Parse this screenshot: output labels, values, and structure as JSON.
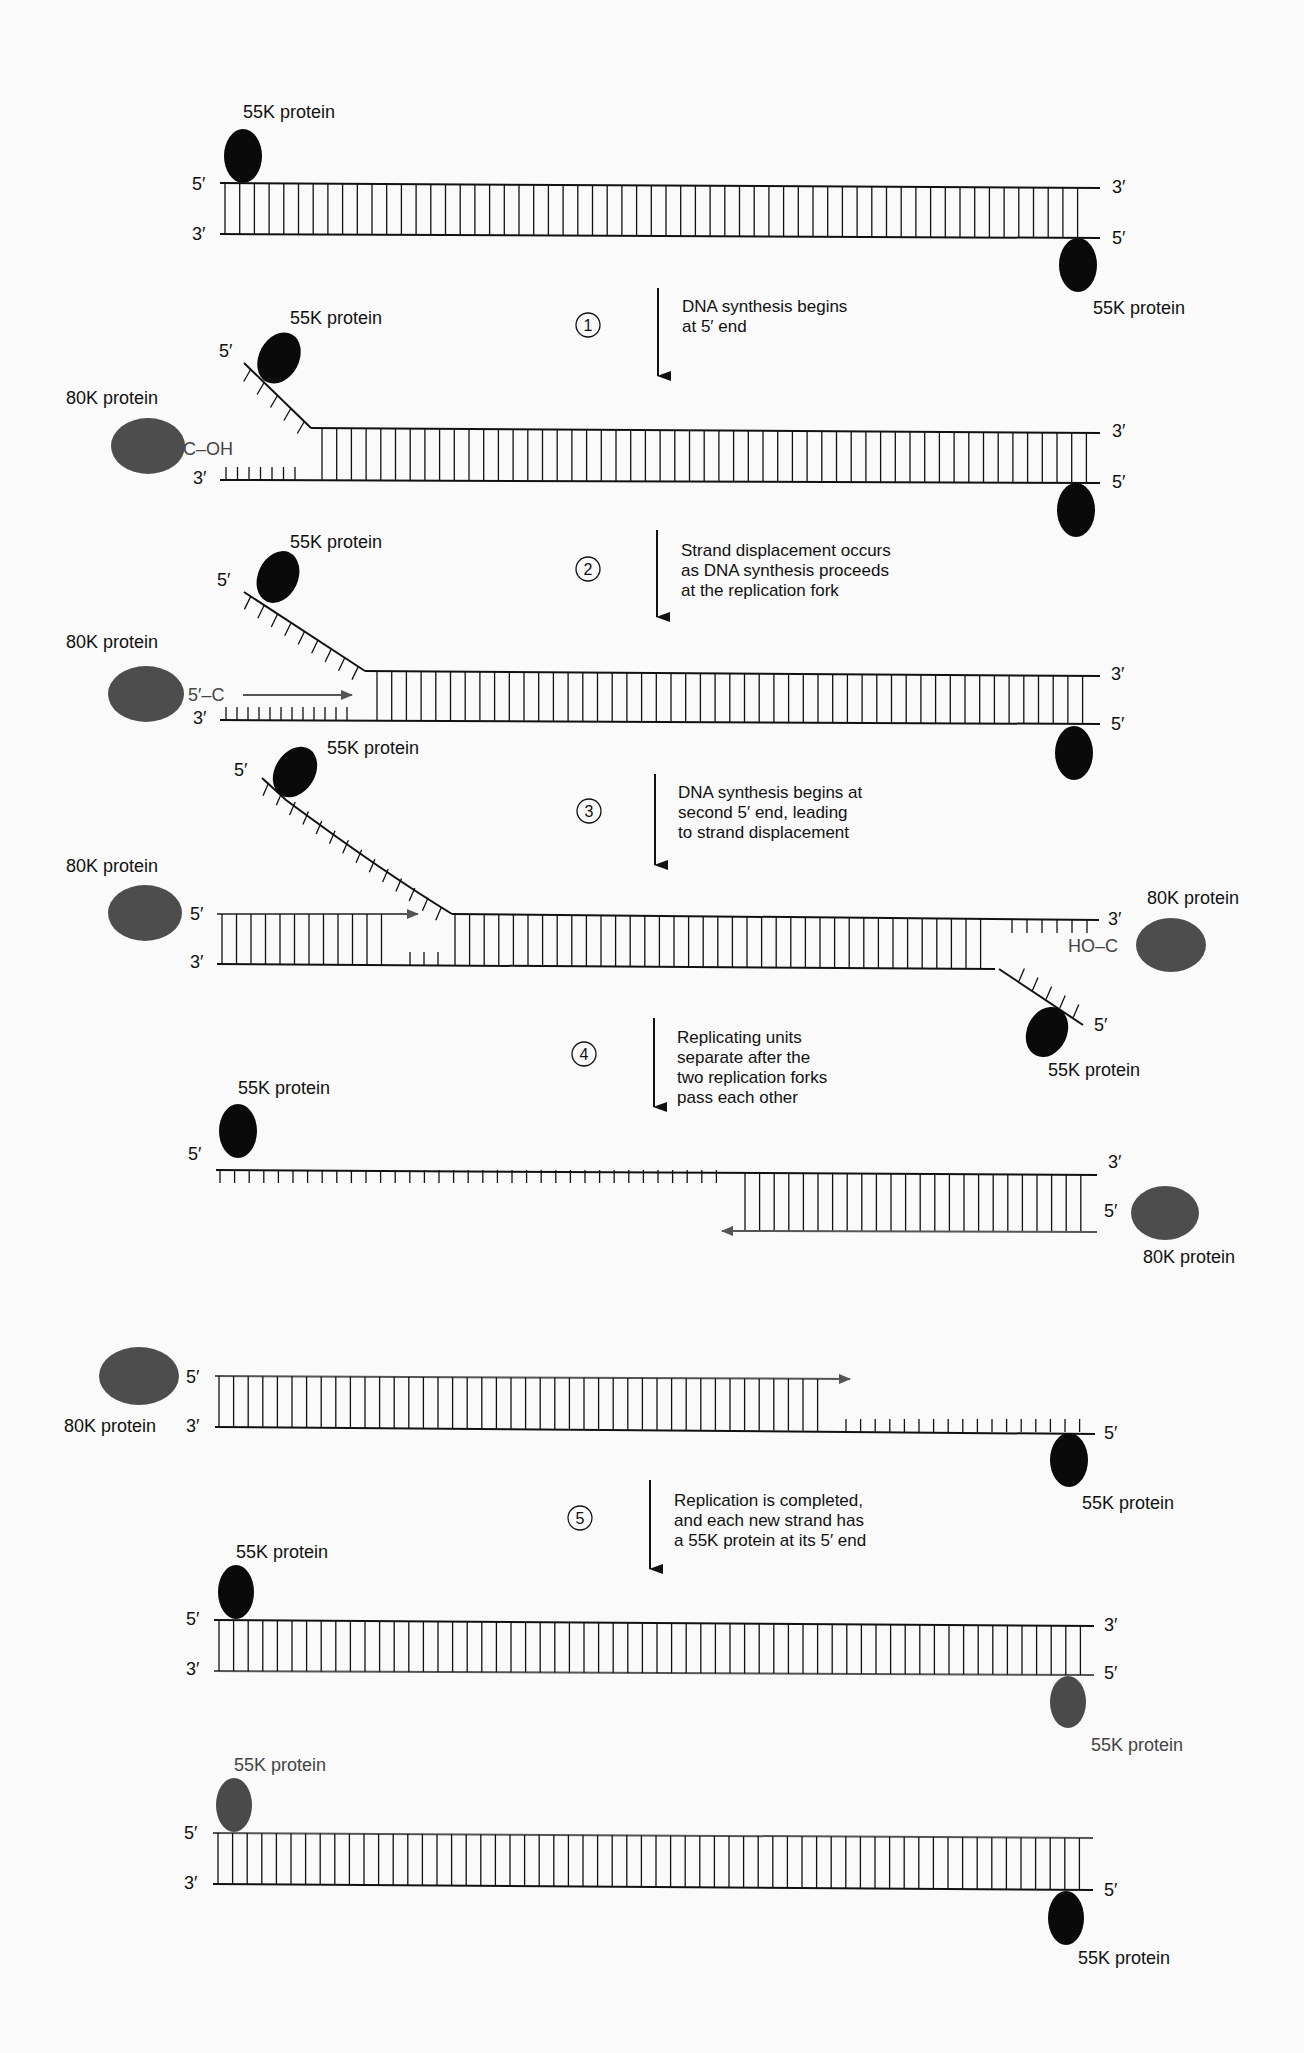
{
  "figure": {
    "colors": {
      "background": "#fafafa",
      "ink": "#111111",
      "protein_55k": "#0a0a0a",
      "protein_80k": "#4d4d4d",
      "protein_55k_new": "#4a4a4a"
    },
    "labels": {
      "p55": "55K protein",
      "p80": "80K protein",
      "five_prime": "5′",
      "three_prime": "3′",
      "c_oh": "C–OH",
      "five_c": "5′–C",
      "ho_c": "HO–C"
    },
    "steps": [
      {
        "number": "1",
        "lines": [
          "DNA synthesis begins",
          "at 5′ end"
        ]
      },
      {
        "number": "2",
        "lines": [
          "Strand displacement occurs",
          "as DNA synthesis proceeds",
          "at the replication fork"
        ]
      },
      {
        "number": "3",
        "lines": [
          "DNA synthesis begins at",
          "second 5′ end, leading",
          "to strand displacement"
        ]
      },
      {
        "number": "4",
        "lines": [
          "Replicating units",
          "separate after the",
          "two replication forks",
          "pass each other"
        ]
      },
      {
        "number": "5",
        "lines": [
          "Replication is completed,",
          "and each new strand has",
          "a 55K protein at its 5′ end"
        ]
      }
    ],
    "stages": [
      {
        "id": "initial",
        "proteins": [
          "55K protein (5′ top-left)",
          "55K protein (5′ bottom-right)"
        ]
      },
      {
        "id": "after-step-1",
        "proteins": [
          "55K protein",
          "80K protein",
          "55K protein"
        ]
      },
      {
        "id": "after-step-2",
        "proteins": [
          "55K protein",
          "80K protein",
          "55K protein"
        ]
      },
      {
        "id": "after-step-3",
        "proteins": [
          "55K protein",
          "80K protein",
          "80K protein",
          "55K protein"
        ]
      },
      {
        "id": "after-step-4-unit-a",
        "proteins": [
          "55K protein",
          "80K protein"
        ]
      },
      {
        "id": "after-step-4-unit-b",
        "proteins": [
          "80K protein",
          "55K protein"
        ]
      },
      {
        "id": "final-a",
        "proteins": [
          "55K protein",
          "55K protein"
        ]
      },
      {
        "id": "final-b",
        "proteins": [
          "55K protein",
          "55K protein"
        ]
      }
    ]
  }
}
